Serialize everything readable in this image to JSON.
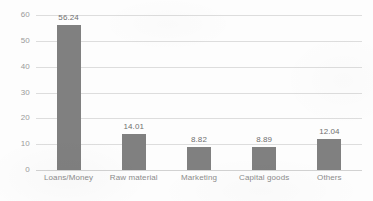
{
  "chart_data": {
    "type": "bar",
    "title": "",
    "subtitle": "",
    "xlabel": "",
    "ylabel": "",
    "categories": [
      "Loans/Money",
      "Raw material",
      "Marketing",
      "Capital goods",
      "Others"
    ],
    "values": [
      56.24,
      14.01,
      8.82,
      8.89,
      12.04
    ],
    "value_labels": [
      "56.24",
      "14.01",
      "8.82",
      "8.89",
      "12.04"
    ],
    "ylim": [
      0,
      60
    ],
    "ytick_values": [
      0,
      10,
      20,
      30,
      40,
      50,
      60
    ],
    "ytick_labels": [
      "0",
      "10",
      "20",
      "30",
      "40",
      "50",
      "60"
    ],
    "grid": "horizontal",
    "legend": "none",
    "series": [
      {
        "name": "",
        "values": [
          56.24,
          14.01,
          8.82,
          8.89,
          12.04
        ]
      }
    ],
    "colors": {
      "bar": "#808080",
      "gridline": "#dddddd",
      "axis": "#d2d2d2",
      "value_label": "#6f6f6f",
      "tick_label": "#9a9a9a",
      "category_label": "#8c8c8c",
      "background": "#fdfdfd"
    }
  }
}
